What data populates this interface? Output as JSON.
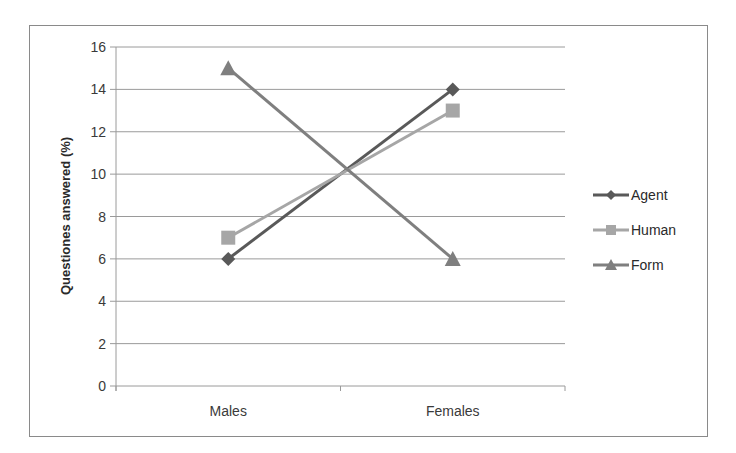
{
  "chart_data": {
    "type": "line",
    "title": "",
    "xlabel": "",
    "ylabel": "Questiones answered (%)",
    "categories": [
      "Males",
      "Females"
    ],
    "ylim": [
      0,
      16
    ],
    "yticks": [
      0,
      2,
      4,
      6,
      8,
      10,
      12,
      14,
      16
    ],
    "grid": true,
    "legend_position": "right",
    "series": [
      {
        "name": "Agent",
        "values": [
          6,
          14
        ],
        "marker": "diamond",
        "color": "#595959"
      },
      {
        "name": "Human",
        "values": [
          7,
          13
        ],
        "marker": "square",
        "color": "#a6a6a6"
      },
      {
        "name": "Form",
        "values": [
          15,
          6
        ],
        "marker": "triangle",
        "color": "#7f7f7f"
      }
    ]
  },
  "legend": {
    "items": [
      {
        "label": "Agent"
      },
      {
        "label": "Human"
      },
      {
        "label": "Form"
      }
    ]
  },
  "axis": {
    "y_title": "Questiones answered (%)",
    "x_labels": [
      "Males",
      "Females"
    ],
    "y_labels": [
      "0",
      "2",
      "4",
      "6",
      "8",
      "10",
      "12",
      "14",
      "16"
    ]
  }
}
